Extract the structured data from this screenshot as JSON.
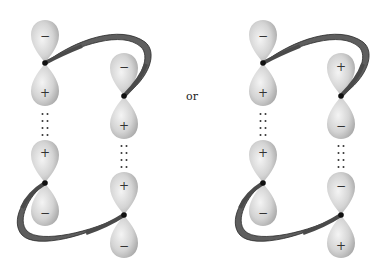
{
  "connector_label": "or",
  "colors": {
    "lobe_light": "#f2f2f2",
    "lobe_mid": "#d2d2d2",
    "lobe_dark": "#a8a8a8",
    "ribbon_fill": "#5e5e5e",
    "ribbon_edge": "#2a2a2a",
    "nucleus": "#111111",
    "dots": "#333333"
  },
  "figures": [
    {
      "name": "left-figure",
      "orbitals": [
        {
          "id": "A-top",
          "cx": 45,
          "cy": 63,
          "top_sign": "−",
          "bottom_sign": "+"
        },
        {
          "id": "B-top",
          "cx": 124,
          "cy": 96,
          "top_sign": "−",
          "bottom_sign": "+"
        },
        {
          "id": "A-bottom",
          "cx": 45,
          "cy": 183,
          "top_sign": "+",
          "bottom_sign": "−"
        },
        {
          "id": "B-bottom",
          "cx": 124,
          "cy": 215,
          "top_sign": "+",
          "bottom_sign": "−"
        }
      ]
    },
    {
      "name": "right-figure",
      "orbitals": [
        {
          "id": "C-top",
          "cx": 263,
          "cy": 63,
          "top_sign": "−",
          "bottom_sign": "+"
        },
        {
          "id": "D-top",
          "cx": 341,
          "cy": 96,
          "top_sign": "+",
          "bottom_sign": "−"
        },
        {
          "id": "C-bottom",
          "cx": 263,
          "cy": 183,
          "top_sign": "+",
          "bottom_sign": "−"
        },
        {
          "id": "D-bottom",
          "cx": 341,
          "cy": 215,
          "top_sign": "−",
          "bottom_sign": "+"
        }
      ]
    }
  ]
}
